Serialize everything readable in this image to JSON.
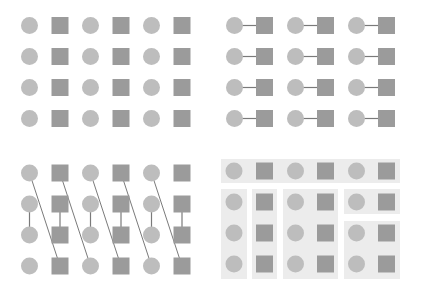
{
  "colors": {
    "background": "#ffffff",
    "circle": "#bdbdbd",
    "square": "#9b9b9b",
    "line": "#7a7a7a",
    "group_box": "#ececec"
  },
  "grid": {
    "rows": 4,
    "columns_per_panel": 6,
    "item_order": [
      "circle",
      "square",
      "circle",
      "square",
      "circle",
      "square"
    ],
    "row_spacing_px": 31,
    "item_size_px": 17
  },
  "panels": [
    {
      "id": "panel-1",
      "position": "top-left",
      "description": "Ungrouped grid of alternating circles and squares",
      "connections": []
    },
    {
      "id": "panel-2",
      "position": "top-right",
      "description": "Each circle connected horizontally to the square on its right",
      "connections": "horizontal circle-square pairs in every row"
    },
    {
      "id": "panel-3",
      "position": "bottom-left",
      "description": "Vertical links between rows 2 and 3 in every column; diagonal lines from top of each column to bottom of next column",
      "connections": "vertical row2-row3 per column; diagonal top(col i) to bottom(col i+1)"
    },
    {
      "id": "panel-4",
      "position": "bottom-right",
      "description": "Common region grouping: top row band, two single-column boxes, a two-column box, and two stacked boxes on right",
      "groups": [
        {
          "name": "top-row-band",
          "x": 221,
          "y": 159,
          "w": 179,
          "h": 24
        },
        {
          "name": "column-1-box",
          "x": 221,
          "y": 189,
          "w": 26,
          "h": 90
        },
        {
          "name": "column-2-box",
          "x": 252,
          "y": 189,
          "w": 25,
          "h": 90
        },
        {
          "name": "columns-3-4-box",
          "x": 283,
          "y": 189,
          "w": 55,
          "h": 90
        },
        {
          "name": "right-top-box",
          "x": 344,
          "y": 189,
          "w": 56,
          "h": 25
        },
        {
          "name": "right-bottom-box",
          "x": 344,
          "y": 221,
          "w": 56,
          "h": 58
        }
      ]
    }
  ]
}
